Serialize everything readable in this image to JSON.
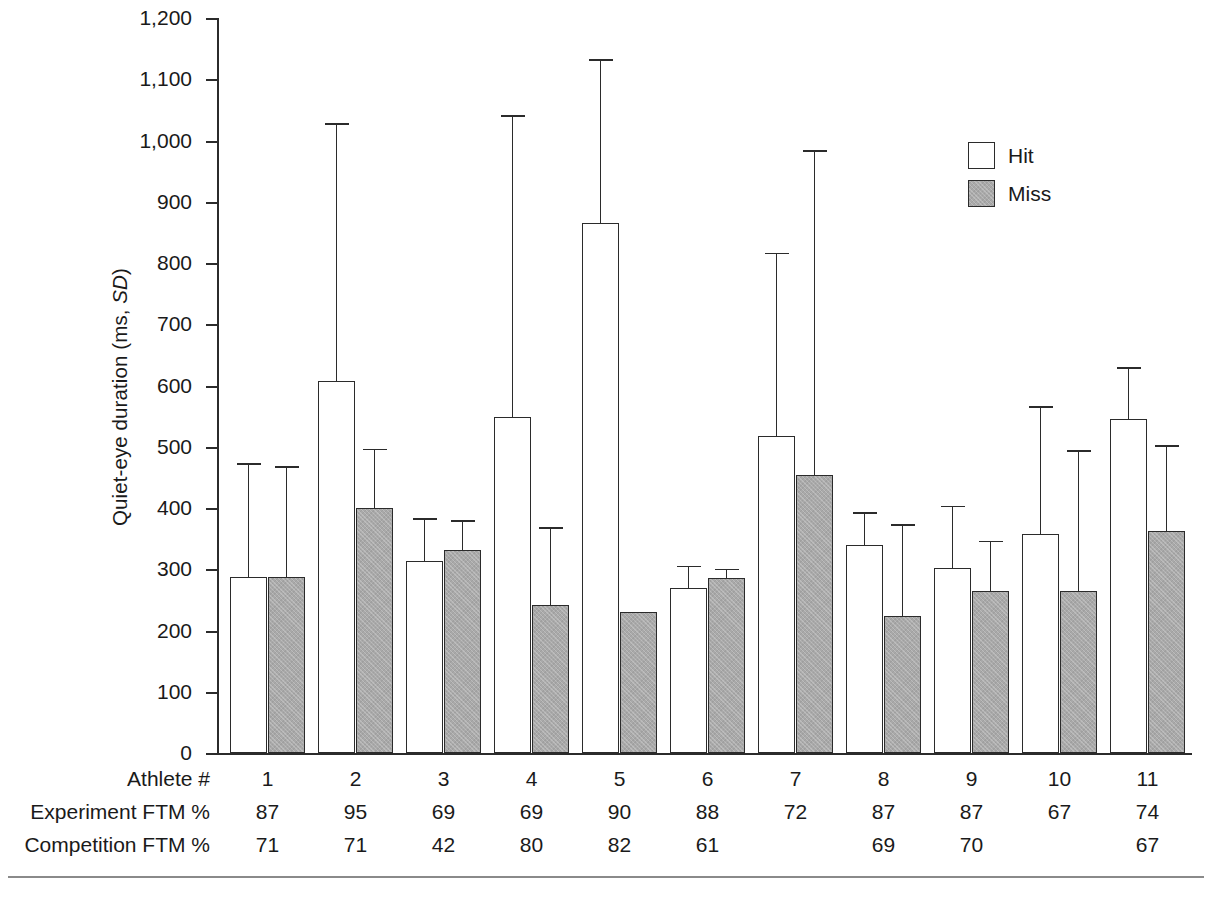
{
  "chart_data": {
    "type": "bar",
    "title": "",
    "xlabel": "Athlete #",
    "ylabel": "Quiet-eye duration (ms, SD)",
    "ylabel_plain": "Quiet-eye duration (ms, ",
    "ylabel_italic": "SD",
    "ylabel_tail": ")",
    "ylim": [
      0,
      1200
    ],
    "ytick_step": 100,
    "ytick_labels": [
      "1,200",
      "1,100",
      "1,000",
      "900",
      "800",
      "700",
      "600",
      "500",
      "400",
      "300",
      "200",
      "100",
      "0"
    ],
    "ytick_values": [
      1200,
      1100,
      1000,
      900,
      800,
      700,
      600,
      500,
      400,
      300,
      200,
      100,
      0
    ],
    "grid": false,
    "legend_position": "top-right",
    "categories": [
      "1",
      "2",
      "3",
      "4",
      "5",
      "6",
      "7",
      "8",
      "9",
      "10",
      "11"
    ],
    "series": [
      {
        "name": "Hit",
        "color": "#ffffff",
        "values": [
          287,
          607,
          313,
          548,
          865,
          270,
          517,
          339,
          302,
          358,
          545
        ],
        "errors": [
          183,
          418,
          68,
          490,
          265,
          33,
          297,
          52,
          99,
          206,
          82
        ],
        "error_tops": [
          470,
          1025,
          381,
          1038,
          1130,
          303,
          814,
          391,
          401,
          564,
          627
        ]
      },
      {
        "name": "Miss",
        "color": "#a9a9a9",
        "values": [
          287,
          400,
          331,
          241,
          230,
          285,
          454,
          224,
          264,
          265,
          362
        ],
        "errors": [
          178,
          94,
          46,
          125,
          null,
          13,
          527,
          147,
          80,
          226,
          138
        ],
        "error_tops": [
          465,
          494,
          377,
          366,
          null,
          298,
          981,
          371,
          344,
          491,
          500
        ]
      }
    ],
    "legend": [
      {
        "label": "Hit",
        "swatch": "hit"
      },
      {
        "label": "Miss",
        "swatch": "miss"
      }
    ],
    "table": {
      "rows": [
        {
          "header": "Athlete #",
          "name": "athlete-number-row",
          "values": [
            "1",
            "2",
            "3",
            "4",
            "5",
            "6",
            "7",
            "8",
            "9",
            "10",
            "11"
          ]
        },
        {
          "header": "Experiment FTM %",
          "name": "experiment-ftm-row",
          "values": [
            "87",
            "95",
            "69",
            "69",
            "90",
            "88",
            "72",
            "87",
            "87",
            "67",
            "74"
          ]
        },
        {
          "header": "Competition FTM %",
          "name": "competition-ftm-row",
          "values": [
            "71",
            "71",
            "42",
            "80",
            "82",
            "61",
            "",
            "69",
            "70",
            "",
            "67"
          ]
        }
      ]
    }
  }
}
